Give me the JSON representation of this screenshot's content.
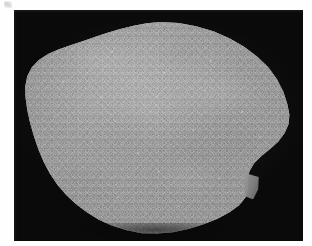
{
  "page": {
    "background_color": "#fefefe",
    "width": 312,
    "height": 246
  },
  "photo": {
    "caption": "",
    "background_color": "#050505",
    "frame": {
      "left": 14,
      "top": 10,
      "width": 289,
      "height": 231
    }
  },
  "specimen": {
    "label": "",
    "description": "Rounded irregular pentagonal rock specimen with fine granular surface texture",
    "base_color": "#979797",
    "highlight_color": "#b4b4b4",
    "shadow_color": "#6f6f6f",
    "parts": {
      "body": "",
      "nub": "",
      "shadow": ""
    }
  },
  "artifact": {
    "label": ""
  }
}
